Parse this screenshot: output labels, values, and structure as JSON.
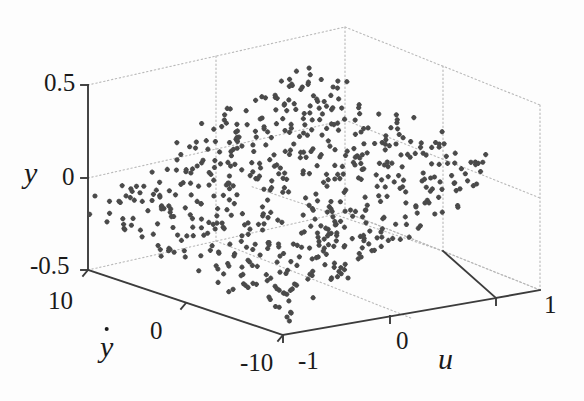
{
  "figure": {
    "kind": "3d-scatter-plot",
    "background_color": "#fdfdfd",
    "marker_color": "#4a4a4a",
    "axis_line_color": "#3c3c3c",
    "grid_color": "#b9b9b9"
  },
  "axes": {
    "vertical": {
      "name": "y",
      "ticks": [
        "0.5",
        "0",
        "-0.5"
      ],
      "tick_values": [
        0.5,
        0,
        -0.5
      ],
      "range": [
        -0.5,
        0.5
      ]
    },
    "left_depth": {
      "name": "ẏ",
      "name_base": "y",
      "ticks": [
        "10",
        "0",
        "-10"
      ],
      "tick_values": [
        10,
        0,
        -10
      ],
      "range": [
        -10,
        10
      ]
    },
    "right_depth": {
      "name": "u",
      "ticks": [
        "-1",
        "0",
        "1"
      ],
      "tick_values": [
        -1,
        0,
        1
      ],
      "range": [
        -1,
        1
      ]
    }
  },
  "chart_data": {
    "type": "scatter",
    "title": "",
    "xlabel": "u",
    "ylabel": "ẏ",
    "zlabel": "y",
    "xlim": [
      -1,
      1
    ],
    "ylim": [
      -10,
      10
    ],
    "zlim": [
      -0.5,
      0.5
    ],
    "grid": true,
    "legend": "none",
    "marker": "plus",
    "marker_color": "#4a4a4a",
    "point_count": 600,
    "plane_model": {
      "intercept": 0.0,
      "u_coefficient": 0.3,
      "ydot_coefficient": 0.012,
      "noise_sigma": 0.055
    },
    "points": [
      {
        "u": -0.95,
        "ydot": 8.6,
        "y": -0.22
      },
      {
        "u": -0.9,
        "ydot": 7.4,
        "y": -0.24
      },
      {
        "u": -0.88,
        "ydot": 9.1,
        "y": -0.19
      },
      {
        "u": -0.84,
        "ydot": 6.2,
        "y": -0.27
      },
      {
        "u": -0.8,
        "ydot": 5.0,
        "y": -0.3
      },
      {
        "u": -0.76,
        "ydot": 8.0,
        "y": -0.21
      },
      {
        "u": -0.7,
        "ydot": 3.4,
        "y": -0.31
      },
      {
        "u": -0.64,
        "ydot": 6.8,
        "y": -0.23
      },
      {
        "u": -0.58,
        "ydot": 1.2,
        "y": -0.29
      },
      {
        "u": -0.52,
        "ydot": 4.5,
        "y": -0.22
      },
      {
        "u": -0.46,
        "ydot": -1.0,
        "y": -0.25
      },
      {
        "u": -0.4,
        "ydot": 2.8,
        "y": -0.18
      },
      {
        "u": -0.34,
        "ydot": 5.6,
        "y": -0.13
      },
      {
        "u": -0.28,
        "ydot": -3.2,
        "y": -0.2
      },
      {
        "u": -0.22,
        "ydot": 0.6,
        "y": -0.12
      },
      {
        "u": -0.16,
        "ydot": 3.9,
        "y": -0.07
      },
      {
        "u": -0.1,
        "ydot": -4.8,
        "y": -0.11
      },
      {
        "u": -0.04,
        "ydot": 1.8,
        "y": -0.02
      },
      {
        "u": 0.02,
        "ydot": -2.4,
        "y": -0.01
      },
      {
        "u": 0.08,
        "ydot": 4.2,
        "y": 0.07
      },
      {
        "u": 0.14,
        "ydot": -6.0,
        "y": -0.01
      },
      {
        "u": 0.2,
        "ydot": 0.4,
        "y": 0.07
      },
      {
        "u": 0.26,
        "ydot": 3.1,
        "y": 0.12
      },
      {
        "u": 0.32,
        "ydot": -5.4,
        "y": 0.04
      },
      {
        "u": 0.38,
        "ydot": 2.2,
        "y": 0.14
      },
      {
        "u": 0.44,
        "ydot": 6.4,
        "y": 0.21
      },
      {
        "u": 0.5,
        "ydot": -1.6,
        "y": 0.13
      },
      {
        "u": 0.56,
        "ydot": 4.8,
        "y": 0.22
      },
      {
        "u": 0.62,
        "ydot": -3.0,
        "y": 0.15
      },
      {
        "u": 0.68,
        "ydot": 7.2,
        "y": 0.28
      },
      {
        "u": 0.74,
        "ydot": 1.0,
        "y": 0.23
      },
      {
        "u": 0.8,
        "ydot": 5.2,
        "y": 0.29
      },
      {
        "u": 0.86,
        "ydot": -2.0,
        "y": 0.24
      },
      {
        "u": 0.92,
        "ydot": 8.4,
        "y": 0.34
      },
      {
        "u": 0.96,
        "ydot": 3.6,
        "y": 0.31
      },
      {
        "u": 0.99,
        "ydot": 6.6,
        "y": 0.35
      }
    ]
  },
  "labels": {
    "y_top": "0.5",
    "y_mid": "0",
    "y_bottom": "-0.5",
    "y_axis_name": "y",
    "ydot_10": "10",
    "ydot_0": "0",
    "ydot_neg10": "-10",
    "ydot_axis_name": "y",
    "u_neg1": "-1",
    "u_0": "0",
    "u_1": "1",
    "u_axis_name": "u"
  }
}
